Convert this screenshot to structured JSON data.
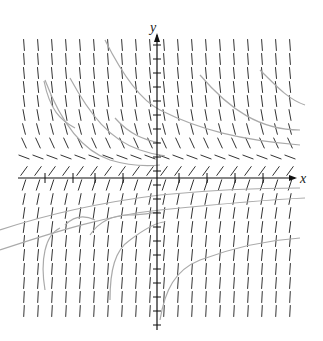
{
  "figure": {
    "type": "slope_field",
    "axes": {
      "x_label": "x",
      "y_label": "y"
    },
    "colors": {
      "segments": "#333333",
      "axes": "#111111",
      "solution_curves": "#aaaaaa"
    },
    "layout": {
      "origin_px": [
        157,
        178
      ],
      "cols": 20,
      "rows": 20,
      "spacing_px": 14,
      "start_px": [
        24,
        45
      ]
    }
  }
}
